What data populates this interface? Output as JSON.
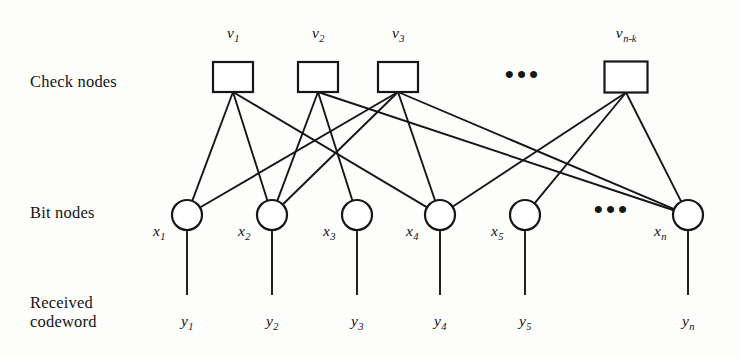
{
  "figure": {
    "kind": "tanner-graph",
    "row_labels": {
      "check_nodes": "Check nodes",
      "bit_nodes": "Bit nodes",
      "received_codeword": "Received\ncodeword"
    },
    "ellipsis_glyph": "•••",
    "colors": {
      "stroke": "#161616",
      "background": "#fdfdfc",
      "text": "#141414"
    }
  },
  "check_nodes": [
    {
      "id": "v1",
      "label_base": "v",
      "label_sub": "1",
      "cx": 233,
      "cy": 77,
      "w": 40,
      "h": 30
    },
    {
      "id": "v2",
      "label_base": "v",
      "label_sub": "2",
      "cx": 318,
      "cy": 77,
      "w": 40,
      "h": 30
    },
    {
      "id": "v3",
      "label_base": "v",
      "label_sub": "3",
      "cx": 398,
      "cy": 77,
      "w": 40,
      "h": 30
    },
    {
      "id": "vnk",
      "label_base": "v",
      "label_sub": "n-k",
      "cx": 626,
      "cy": 77,
      "w": 43,
      "h": 31
    }
  ],
  "bit_nodes": [
    {
      "id": "x1",
      "label_base": "x",
      "label_sub": "1",
      "cx": 187,
      "cy": 215,
      "r": 15
    },
    {
      "id": "x2",
      "label_base": "x",
      "label_sub": "2",
      "cx": 272,
      "cy": 215,
      "r": 15
    },
    {
      "id": "x3",
      "label_base": "x",
      "label_sub": "3",
      "cx": 357,
      "cy": 215,
      "r": 15
    },
    {
      "id": "x4",
      "label_base": "x",
      "label_sub": "4",
      "cx": 440,
      "cy": 215,
      "r": 15
    },
    {
      "id": "x5",
      "label_base": "x",
      "label_sub": "5",
      "cx": 525,
      "cy": 215,
      "r": 15
    },
    {
      "id": "xn",
      "label_base": "x",
      "label_sub": "n",
      "cx": 688,
      "cy": 215,
      "r": 15
    }
  ],
  "received_labels": [
    {
      "id": "y1",
      "label_base": "y",
      "label_sub": "1",
      "cx": 187
    },
    {
      "id": "y2",
      "label_base": "y",
      "label_sub": "2",
      "cx": 272
    },
    {
      "id": "y3",
      "label_base": "y",
      "label_sub": "3",
      "cx": 357
    },
    {
      "id": "y4",
      "label_base": "y",
      "label_sub": "4",
      "cx": 440
    },
    {
      "id": "y5",
      "label_base": "y",
      "label_sub": "5",
      "cx": 525
    },
    {
      "id": "yn",
      "label_base": "y",
      "label_sub": "n",
      "cx": 688
    }
  ],
  "ellipses": [
    {
      "id": "check-row-ellipsis",
      "cx": 523,
      "cy": 80
    },
    {
      "id": "bit-row-ellipsis",
      "cx": 612,
      "cy": 215
    }
  ],
  "edges": [
    {
      "from": "v1",
      "to": "x1"
    },
    {
      "from": "v1",
      "to": "x2"
    },
    {
      "from": "v1",
      "to": "x4"
    },
    {
      "from": "v2",
      "to": "x2"
    },
    {
      "from": "v2",
      "to": "x3"
    },
    {
      "from": "v2",
      "to": "xn"
    },
    {
      "from": "v3",
      "to": "x1"
    },
    {
      "from": "v3",
      "to": "x2"
    },
    {
      "from": "v3",
      "to": "x4"
    },
    {
      "from": "v3",
      "to": "xn"
    },
    {
      "from": "vnk",
      "to": "x4"
    },
    {
      "from": "vnk",
      "to": "x5"
    },
    {
      "from": "vnk",
      "to": "xn"
    }
  ],
  "stems": [
    {
      "id": "stem-x1",
      "cx": 187,
      "y1": 230,
      "y2": 295
    },
    {
      "id": "stem-x2",
      "cx": 272,
      "y1": 230,
      "y2": 295
    },
    {
      "id": "stem-x3",
      "cx": 357,
      "y1": 230,
      "y2": 295
    },
    {
      "id": "stem-x4",
      "cx": 440,
      "y1": 230,
      "y2": 295
    },
    {
      "id": "stem-x5",
      "cx": 525,
      "y1": 230,
      "y2": 295
    },
    {
      "id": "stem-xn",
      "cx": 688,
      "y1": 230,
      "y2": 295
    }
  ]
}
